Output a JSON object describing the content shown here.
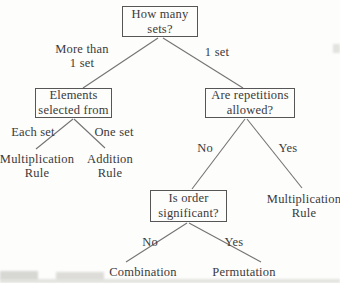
{
  "diagram": {
    "nodes": {
      "how_many_sets": {
        "line1": "How many",
        "line2": "sets?"
      },
      "elements_selected_from": {
        "line1": "Elements",
        "line2": "selected from"
      },
      "are_repetitions_allowed": {
        "line1": "Are repetitions",
        "line2": "allowed?"
      },
      "is_order_significant": {
        "line1": "Is order",
        "line2": "significant?"
      }
    },
    "branch_labels": {
      "more_than_1_set": {
        "line1": "More than",
        "line2": "1 set"
      },
      "one_set_top": "1 set",
      "each_set": "Each set",
      "one_set": "One set",
      "repetitions_no": "No",
      "repetitions_yes": "Yes",
      "order_no": "No",
      "order_yes": "Yes"
    },
    "outcomes": {
      "multiplication_rule_left": {
        "line1": "Multiplication",
        "line2": "Rule"
      },
      "addition_rule": {
        "line1": "Addition",
        "line2": "Rule"
      },
      "multiplication_rule_right": {
        "line1": "Multiplication",
        "line2": "Rule"
      },
      "combination": "Combination",
      "permutation": "Permutation"
    },
    "colors": {
      "text": "#3a3a3a",
      "box_border": "#565656",
      "connector": "#646464",
      "background": "#fdfdfc"
    }
  }
}
